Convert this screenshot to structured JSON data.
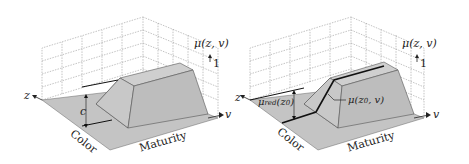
{
  "figure": {
    "colors": {
      "grid": "#9a9a9a",
      "floor": "#c4c4c4",
      "solid_top": "#cdcdcd",
      "solid_side": "#bdbdbd",
      "edge": "#555555",
      "highlight": "#111111"
    },
    "left_panel": {
      "z_axis_label": "z",
      "v_axis_label": "v",
      "mu_label": "μ(z, v)",
      "one_label": "1",
      "c_label": "c",
      "color_axis_label": "Color",
      "maturity_axis_label": "Maturity"
    },
    "right_panel": {
      "z_axis_label": "z",
      "v_axis_label": "v",
      "mu_label": "μ(z, v)",
      "one_label": "1",
      "mu_red_label": "μ",
      "mu_red_sub": "red",
      "mu_red_arg": "(z",
      "mu_red_arg_sub": "0",
      "mu_red_close": ")",
      "mu_slice_label": "μ(z",
      "mu_slice_sub": "0",
      "mu_slice_tail": ", v)",
      "color_axis_label": "Color",
      "maturity_axis_label": "Maturity"
    }
  }
}
